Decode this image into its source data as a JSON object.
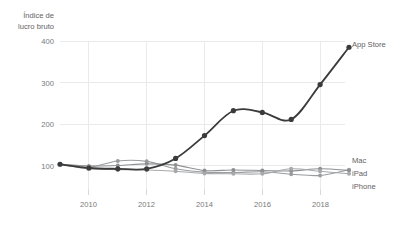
{
  "chart_data": {
    "type": "line",
    "title": "",
    "ylabel": "Índice de lucro bruto",
    "xlabel": "",
    "ylabel_line1": "Índice de",
    "ylabel_line2": "lucro bruto",
    "grid": true,
    "legend_position": "right-end-labels",
    "xlim": [
      2009,
      2019
    ],
    "ylim": [
      0,
      420
    ],
    "yticks": [
      100,
      200,
      300,
      400
    ],
    "ytick_labels": [
      "100",
      "200",
      "300",
      "400"
    ],
    "xticks": [
      2010,
      2012,
      2014,
      2016,
      2018
    ],
    "xtick_labels": [
      "2010",
      "2012",
      "2014",
      "2016",
      "2018"
    ],
    "x": [
      2009,
      2010,
      2011,
      2012,
      2013,
      2014,
      2015,
      2016,
      2017,
      2018,
      2019
    ],
    "series": [
      {
        "name": "App Store",
        "color": "#3b3b3b",
        "values": [
          103,
          94,
          92,
          92,
          117,
          172,
          232,
          228,
          211,
          295,
          385
        ]
      },
      {
        "name": "Mac",
        "color": "#9a9c9e",
        "values": [
          103,
          96,
          111,
          110,
          92,
          84,
          83,
          85,
          79,
          76,
          90
        ]
      },
      {
        "name": "iPad",
        "color": "#8e9092",
        "values": [
          103,
          99,
          100,
          104,
          101,
          88,
          89,
          88,
          87,
          92,
          88
        ]
      },
      {
        "name": "iPhone",
        "color": "#a7a9ab",
        "values": [
          103,
          92,
          90,
          89,
          86,
          81,
          80,
          80,
          92,
          86,
          80
        ]
      }
    ]
  },
  "labels": {
    "app_store": "App Store",
    "mac": "Mac",
    "ipad": "iPad",
    "iphone": "iPhone"
  }
}
